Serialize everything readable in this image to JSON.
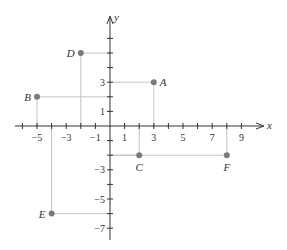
{
  "chart_data": {
    "type": "scatter",
    "title": "",
    "xlabel": "x",
    "ylabel": "y",
    "xlim": [
      -6.5,
      10.5
    ],
    "ylim": [
      -7.7,
      7.5
    ],
    "grid": false,
    "x_tick_labels": [
      -5,
      -3,
      -1,
      1,
      3,
      5,
      7,
      9
    ],
    "y_tick_labels": [
      3,
      1,
      -3,
      -5,
      -7
    ],
    "x_ticks": [
      -6,
      -5,
      -4,
      -3,
      -2,
      -1,
      1,
      2,
      3,
      4,
      5,
      6,
      7,
      8,
      9
    ],
    "y_ticks": [
      6,
      5,
      4,
      3,
      2,
      1,
      -1,
      -2,
      -3,
      -4,
      -5,
      -6,
      -7
    ],
    "points": [
      {
        "label": "A",
        "x": 3,
        "y": 3,
        "label_pos": "right"
      },
      {
        "label": "B",
        "x": -5,
        "y": 2,
        "label_pos": "left"
      },
      {
        "label": "C",
        "x": 2,
        "y": -2,
        "label_pos": "below"
      },
      {
        "label": "D",
        "x": -2,
        "y": 5,
        "label_pos": "left"
      },
      {
        "label": "E",
        "x": -4,
        "y": -6,
        "label_pos": "left"
      },
      {
        "label": "F",
        "x": 8,
        "y": -2,
        "label_pos": "below"
      }
    ]
  },
  "colors": {
    "axis": "#333333",
    "point": "#7a7a7a",
    "guide": "#c4c4c4"
  },
  "layout": {
    "origin_x": 110,
    "origin_y": 126,
    "unit": 14.6,
    "x_axis_start": 15,
    "x_axis_end": 264,
    "y_axis_top": 16,
    "y_axis_bottom": 240
  }
}
